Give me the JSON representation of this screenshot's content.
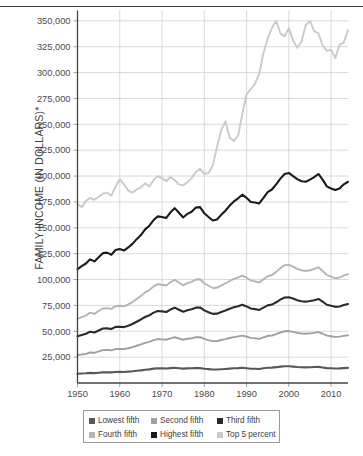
{
  "chart_data": {
    "type": "line",
    "title": "",
    "xlabel": "",
    "ylabel": "FAMILY INCOME (IN DOLLARS)*",
    "xlim": [
      1950,
      2014
    ],
    "ylim": [
      0,
      360000
    ],
    "grid": true,
    "legend_position": "bottom",
    "x_ticks": [
      1950,
      1960,
      1970,
      1980,
      1990,
      2000,
      2010
    ],
    "y_ticks": [
      25000,
      50000,
      75000,
      100000,
      125000,
      150000,
      175000,
      200000,
      225000,
      250000,
      275000,
      300000,
      325000,
      350000
    ],
    "y_tick_labels": [
      "25,000",
      "50,000",
      "75,000",
      "100,000",
      "125,000",
      "150,000",
      "175,000",
      "200,000",
      "225,000",
      "250,000",
      "275,000",
      "300,000",
      "325,000",
      "350,000"
    ],
    "x_tick_labels": [
      "1950",
      "1960",
      "1970",
      "1980",
      "1990",
      "2000",
      "2010"
    ],
    "x": [
      1950,
      1951,
      1952,
      1953,
      1954,
      1955,
      1956,
      1957,
      1958,
      1959,
      1960,
      1961,
      1962,
      1963,
      1964,
      1965,
      1966,
      1967,
      1968,
      1969,
      1970,
      1971,
      1972,
      1973,
      1974,
      1975,
      1976,
      1977,
      1978,
      1979,
      1980,
      1981,
      1982,
      1983,
      1984,
      1985,
      1986,
      1987,
      1988,
      1989,
      1990,
      1991,
      1992,
      1993,
      1994,
      1995,
      1996,
      1997,
      1998,
      1999,
      2000,
      2001,
      2002,
      2003,
      2004,
      2005,
      2006,
      2007,
      2008,
      2009,
      2010,
      2011,
      2012,
      2013,
      2014
    ],
    "series": [
      {
        "name": "Lowest fifth",
        "color": "#585858",
        "values": [
          9000,
          9200,
          9400,
          9800,
          9500,
          9900,
          10300,
          10400,
          10300,
          10700,
          10800,
          10700,
          11000,
          11300,
          11800,
          12200,
          12800,
          13200,
          13900,
          14200,
          14100,
          14000,
          14400,
          14700,
          14300,
          13900,
          14100,
          14200,
          14500,
          14400,
          13800,
          13400,
          13000,
          13000,
          13300,
          13600,
          13900,
          14200,
          14400,
          14700,
          14300,
          13800,
          13800,
          13600,
          14200,
          14800,
          14900,
          15300,
          15800,
          16200,
          16200,
          15800,
          15400,
          15200,
          15100,
          15200,
          15400,
          15600,
          15000,
          14400,
          14200,
          14000,
          14100,
          14400,
          14600
        ]
      },
      {
        "name": "Second fifth",
        "color": "#a0a0a0",
        "values": [
          27000,
          27500,
          28200,
          29500,
          29200,
          30500,
          31800,
          32000,
          31600,
          32800,
          33000,
          32800,
          33600,
          34600,
          36000,
          37300,
          38800,
          39800,
          41400,
          42400,
          42200,
          41800,
          43200,
          44200,
          43000,
          41800,
          42800,
          43200,
          44200,
          44300,
          42600,
          41500,
          40500,
          40600,
          41600,
          42400,
          43500,
          44300,
          45000,
          45800,
          44800,
          43600,
          43200,
          42700,
          44100,
          45400,
          45900,
          47200,
          48800,
          50000,
          50200,
          49400,
          48400,
          47800,
          47600,
          48000,
          48500,
          49200,
          47600,
          45800,
          45200,
          44600,
          44800,
          45600,
          46200
        ]
      },
      {
        "name": "Third fifth",
        "color": "#2b2b2b",
        "values": [
          45200,
          46400,
          47600,
          49600,
          48800,
          50800,
          52600,
          52800,
          52200,
          54200,
          54400,
          54000,
          55400,
          57000,
          59200,
          61400,
          63800,
          65400,
          68000,
          69600,
          69200,
          68600,
          71000,
          72800,
          70800,
          68800,
          70400,
          71200,
          72800,
          73000,
          70200,
          68400,
          66800,
          67000,
          68600,
          70000,
          71800,
          73200,
          74200,
          75600,
          74000,
          72000,
          71400,
          70600,
          72800,
          75000,
          75800,
          78000,
          80600,
          82600,
          82900,
          81600,
          80000,
          79000,
          78600,
          79200,
          80000,
          81200,
          78600,
          75600,
          74600,
          73600,
          74000,
          75400,
          76400
        ]
      },
      {
        "name": "Fourth fifth",
        "color": "#b4b4b4",
        "values": [
          62000,
          63600,
          65200,
          68000,
          66800,
          69600,
          72000,
          72400,
          71600,
          74200,
          74600,
          74000,
          76000,
          78200,
          81200,
          84200,
          87600,
          89800,
          93400,
          95600,
          95000,
          94200,
          97400,
          99800,
          97200,
          94400,
          96600,
          97800,
          100000,
          100200,
          96400,
          94000,
          91800,
          92000,
          94200,
          96200,
          98600,
          100600,
          102000,
          103800,
          101800,
          99000,
          98200,
          97200,
          100200,
          103200,
          104400,
          107400,
          111000,
          113800,
          114200,
          112400,
          110200,
          108800,
          108200,
          109000,
          110200,
          111800,
          108200,
          104200,
          102800,
          101400,
          102000,
          103800,
          105200
        ]
      },
      {
        "name": "Highest fifth",
        "color": "#1a1a1a",
        "values": [
          110000,
          113000,
          115500,
          119500,
          117500,
          121500,
          125500,
          126000,
          124000,
          128500,
          129500,
          128000,
          131000,
          134500,
          139000,
          143000,
          148500,
          152000,
          157500,
          161000,
          160500,
          159500,
          165000,
          169000,
          164500,
          160000,
          163500,
          165500,
          169500,
          170000,
          164000,
          160500,
          157000,
          158000,
          162500,
          166500,
          171500,
          175500,
          178500,
          182000,
          179000,
          175000,
          174500,
          173500,
          179000,
          184500,
          187000,
          192000,
          197500,
          202000,
          203000,
          200000,
          197000,
          195000,
          194500,
          196500,
          199000,
          202000,
          196500,
          190000,
          188000,
          186500,
          188000,
          192000,
          194500
        ]
      },
      {
        "name": "Top 5 percent",
        "color": "#cacaca",
        "values": [
          173000,
          170000,
          176000,
          179000,
          177000,
          180000,
          183000,
          184000,
          181000,
          190000,
          197000,
          192000,
          186000,
          184000,
          187000,
          189000,
          193000,
          190000,
          196000,
          200000,
          198000,
          195000,
          199000,
          196000,
          192000,
          191000,
          194000,
          198000,
          204000,
          207000,
          202000,
          203000,
          210000,
          228000,
          244000,
          253000,
          237000,
          234000,
          239000,
          260000,
          279000,
          284000,
          289000,
          299000,
          319000,
          333000,
          343000,
          350000,
          338000,
          335000,
          343000,
          331000,
          324000,
          330000,
          346000,
          350000,
          340000,
          338000,
          326000,
          321000,
          322000,
          314000,
          327000,
          329000,
          341000
        ]
      }
    ]
  },
  "legend": {
    "items": [
      {
        "label": "Lowest fifth",
        "color": "#585858"
      },
      {
        "label": "Second fifth",
        "color": "#a0a0a0"
      },
      {
        "label": "Third fifth",
        "color": "#2b2b2b"
      },
      {
        "label": "Fourth fifth",
        "color": "#b4b4b4"
      },
      {
        "label": "Highest fifth",
        "color": "#1a1a1a"
      },
      {
        "label": "Top 5 percent",
        "color": "#cacaca"
      }
    ]
  }
}
